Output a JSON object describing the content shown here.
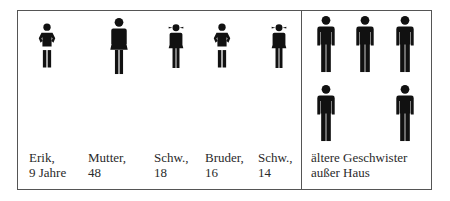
{
  "diagram": {
    "type": "family-pictogram",
    "colors": {
      "figure": "#111111",
      "border": "#555555",
      "text": "#2a2a2a"
    },
    "household": [
      {
        "name": "Erik",
        "age_label": "9 Jahre",
        "line1": "Erik,",
        "line2": "9 Jahre",
        "icon": "boy-icon"
      },
      {
        "name": "Mutter",
        "age_label": "48",
        "line1": "Mutter,",
        "line2": "48",
        "icon": "woman-icon"
      },
      {
        "name": "Schw.",
        "age_label": "18",
        "line1": "Schw.,",
        "line2": "18",
        "icon": "girl-icon"
      },
      {
        "name": "Bruder",
        "age_label": "16",
        "line1": "Bruder,",
        "line2": "16",
        "icon": "boy-icon"
      },
      {
        "name": "Schw.",
        "age_label": "14",
        "line1": "Schw.,",
        "line2": "14",
        "icon": "girl-icon"
      }
    ],
    "outside": {
      "line1": "ältere Geschwister",
      "line2": "außer Haus",
      "count": 5,
      "icon": "man-icon"
    }
  }
}
